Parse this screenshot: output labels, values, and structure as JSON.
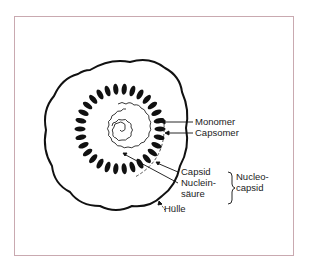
{
  "diagram": {
    "type": "virus-structure-cross-section",
    "labels": {
      "monomer": "Monomer",
      "capsomer": "Capsomer",
      "capsid": "Capsid",
      "nucleic_acid_line1": "Nuclein-",
      "nucleic_acid_line2": "säure",
      "nucleocapsid_line1": "Nucleo-",
      "nucleocapsid_line2": "capsid",
      "envelope": "Hülle"
    },
    "colors": {
      "ink": "#111111",
      "frame_border": "#c9a9b0",
      "background": "#ffffff"
    }
  }
}
